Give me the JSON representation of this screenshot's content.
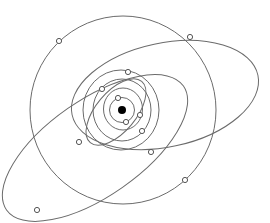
{
  "diagram": {
    "title": "",
    "colors": {
      "background": "#ffffff",
      "orbit": "#6b6b6b",
      "planet_stroke": "#555555",
      "planet_fill": "#ffffff",
      "sun": "#000000"
    },
    "sun": {
      "cx": 122,
      "cy": 110,
      "r": 4
    },
    "orbits": [
      {
        "name": "orbit-1",
        "cx": 122,
        "cy": 110,
        "rx": 12.5,
        "ry": 12.5,
        "rotate": 0
      },
      {
        "name": "orbit-2",
        "cx": 123,
        "cy": 109,
        "rx": 19.5,
        "ry": 21,
        "rotate": 0
      },
      {
        "name": "orbit-3",
        "cx": 122,
        "cy": 110,
        "rx": 29,
        "ry": 31,
        "rotate": 0
      },
      {
        "name": "orbit-4",
        "cx": 121,
        "cy": 110,
        "rx": 38,
        "ry": 40,
        "rotate": 0
      },
      {
        "name": "orbit-5",
        "cx": 123,
        "cy": 110,
        "rx": 93,
        "ry": 94,
        "rotate": 0
      },
      {
        "name": "orbit-6",
        "cx": 165,
        "cy": 95,
        "rx": 95,
        "ry": 52,
        "rotate": -12
      },
      {
        "name": "orbit-7",
        "cx": 95,
        "cy": 148,
        "rx": 108,
        "ry": 48,
        "rotate": -35
      },
      {
        "name": "orbit-8",
        "cx": 116,
        "cy": 112,
        "rx": 40,
        "ry": 20,
        "rotate": -50
      }
    ],
    "planets": [
      {
        "cx": 118,
        "cy": 98
      },
      {
        "cx": 126,
        "cy": 122
      },
      {
        "cx": 140,
        "cy": 115
      },
      {
        "cx": 102,
        "cy": 89
      },
      {
        "cx": 142,
        "cy": 131
      },
      {
        "cx": 128,
        "cy": 72
      },
      {
        "cx": 79,
        "cy": 142
      },
      {
        "cx": 151,
        "cy": 152
      },
      {
        "cx": 59,
        "cy": 41
      },
      {
        "cx": 190,
        "cy": 37
      },
      {
        "cx": 185,
        "cy": 180
      },
      {
        "cx": 37,
        "cy": 210
      }
    ]
  }
}
